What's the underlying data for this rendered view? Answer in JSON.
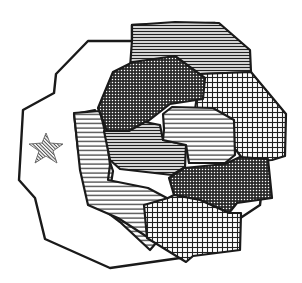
{
  "map": {
    "background": "#ffffff",
    "ink": "#1a1a1a",
    "outer_region": {
      "name": "outer-territory",
      "fill": "none"
    },
    "marker": {
      "type": "star",
      "label": "capital-star-icon",
      "fill_pattern": "fine-diagonal"
    },
    "regions": [
      {
        "name": "region-top-horizontal",
        "pattern": "horizontal-dense"
      },
      {
        "name": "region-upper-dotted",
        "pattern": "dense-crosshatch-dark"
      },
      {
        "name": "region-right-grid",
        "pattern": "grid"
      },
      {
        "name": "region-left-horizontal",
        "pattern": "horizontal-sparse"
      },
      {
        "name": "region-center-horizontal-dark",
        "pattern": "horizontal-dense"
      },
      {
        "name": "region-center-right-horizontal",
        "pattern": "horizontal-sparse"
      },
      {
        "name": "region-lower-right-dotted",
        "pattern": "dense-crosshatch-dark"
      },
      {
        "name": "region-bottom-grid",
        "pattern": "grid"
      }
    ]
  }
}
